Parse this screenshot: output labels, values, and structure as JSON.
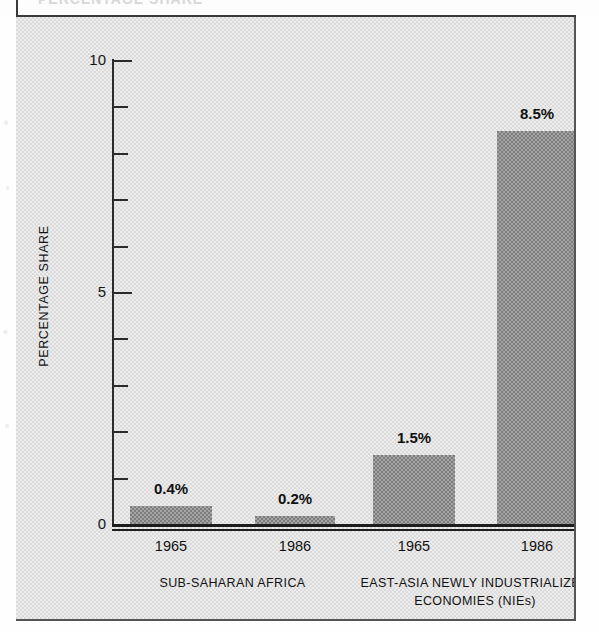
{
  "page": {
    "width": 599,
    "height": 632,
    "background_color": "#ffffff",
    "panel_color": "#d9d9d9",
    "bar_color": "#7d7d7d",
    "ink_color": "#1d1d1d",
    "title_fragment": "PERCENTAGE SHARE"
  },
  "chart_data": {
    "type": "bar",
    "title": "",
    "xlabel": "",
    "ylabel": "PERCENTAGE SHARE",
    "ylim": [
      0,
      10
    ],
    "grid": false,
    "legend": "none",
    "y_ticks": [
      {
        "value": 10,
        "label": "10",
        "major": true
      },
      {
        "value": 9,
        "label": "",
        "major": false
      },
      {
        "value": 8,
        "label": "",
        "major": false
      },
      {
        "value": 7,
        "label": "",
        "major": false
      },
      {
        "value": 6,
        "label": "",
        "major": false
      },
      {
        "value": 5,
        "label": "5",
        "major": true
      },
      {
        "value": 4,
        "label": "",
        "major": false
      },
      {
        "value": 3,
        "label": "",
        "major": false
      },
      {
        "value": 2,
        "label": "",
        "major": false
      },
      {
        "value": 1,
        "label": "",
        "major": false
      },
      {
        "value": 0,
        "label": "0",
        "major": true
      }
    ],
    "categories": [
      "1965",
      "1986",
      "1965",
      "1986"
    ],
    "values": [
      0.4,
      0.2,
      1.5,
      8.5
    ],
    "value_labels": [
      "0.4%",
      "0.2%",
      "1.5%",
      "8.5%"
    ],
    "groups": [
      {
        "label": "SUB-SAHARAN AFRICA",
        "lines": [
          "SUB-SAHARAN AFRICA"
        ],
        "bars": [
          0,
          1
        ]
      },
      {
        "label": "EAST-ASIA NEWLY INDUSTRIALIZED ECONOMIES (NIEs)",
        "lines": [
          "EAST-ASIA NEWLY INDUSTRIALIZED",
          "ECONOMIES (NIEs)"
        ],
        "bars": [
          2,
          3
        ]
      }
    ],
    "bars": [
      {
        "label": "1965",
        "group": "SUB-SAHARAN AFRICA",
        "value": 0.4,
        "value_label": "0.4%",
        "x": 114,
        "width": 82
      },
      {
        "label": "1986",
        "group": "SUB-SAHARAN AFRICA",
        "value": 0.2,
        "value_label": "0.2%",
        "x": 239,
        "width": 80
      },
      {
        "label": "1965",
        "group": "EAST-ASIA NEWLY INDUSTRIALIZED ECONOMIES (NIEs)",
        "value": 1.5,
        "value_label": "1.5%",
        "x": 357,
        "width": 82
      },
      {
        "label": "1986",
        "group": "EAST-ASIA NEWLY INDUSTRIALIZED ECONOMIES (NIEs)",
        "value": 8.5,
        "value_label": "8.5%",
        "x": 481,
        "width": 80
      }
    ]
  }
}
